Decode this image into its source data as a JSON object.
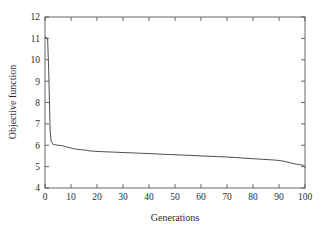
{
  "chart_data": {
    "type": "line",
    "title": "",
    "xlabel": "Generations",
    "ylabel": "Objective function",
    "xlim": [
      0,
      100
    ],
    "ylim": [
      4,
      12
    ],
    "xticks": [
      0,
      10,
      20,
      30,
      40,
      50,
      60,
      70,
      80,
      90,
      100
    ],
    "yticks": [
      4,
      5,
      6,
      7,
      8,
      9,
      10,
      11,
      12
    ],
    "xtick_labels": [
      "0",
      "10",
      "20",
      "30",
      "40",
      "50",
      "60",
      "70",
      "80",
      "90",
      "100"
    ],
    "ytick_labels": [
      "4",
      "5",
      "6",
      "7",
      "8",
      "9",
      "10",
      "11",
      "12"
    ],
    "grid": false,
    "legend": false,
    "legend_position": "none",
    "line_color": "#3a3a3a",
    "frame_color": "#555555",
    "background_color": "#ffffff",
    "series": [
      {
        "name": "Objective function",
        "x": [
          0,
          1,
          1.4,
          1.8,
          2,
          2.4,
          3,
          4,
          5,
          6,
          7,
          8,
          9,
          10,
          11,
          12,
          13,
          14,
          15,
          16,
          17,
          18,
          19,
          20,
          22,
          24,
          26,
          28,
          30,
          32,
          34,
          36,
          38,
          40,
          42,
          44,
          46,
          48,
          50,
          52,
          54,
          56,
          58,
          60,
          62,
          64,
          66,
          68,
          70,
          72,
          74,
          76,
          78,
          80,
          82,
          84,
          86,
          88,
          90,
          91,
          92,
          93,
          94,
          95,
          96,
          97,
          98,
          99,
          99.5,
          100
        ],
        "y": [
          11.05,
          11.0,
          9.6,
          7.6,
          6.6,
          6.18,
          6.05,
          6.02,
          6.0,
          5.99,
          5.97,
          5.93,
          5.9,
          5.87,
          5.84,
          5.82,
          5.8,
          5.79,
          5.78,
          5.76,
          5.74,
          5.73,
          5.72,
          5.71,
          5.7,
          5.69,
          5.68,
          5.67,
          5.66,
          5.65,
          5.64,
          5.63,
          5.62,
          5.61,
          5.6,
          5.585,
          5.575,
          5.565,
          5.555,
          5.545,
          5.535,
          5.525,
          5.515,
          5.5,
          5.49,
          5.48,
          5.47,
          5.46,
          5.45,
          5.435,
          5.42,
          5.4,
          5.385,
          5.37,
          5.355,
          5.34,
          5.325,
          5.31,
          5.29,
          5.27,
          5.25,
          5.22,
          5.19,
          5.16,
          5.13,
          5.11,
          5.09,
          5.07,
          5.05,
          4.97
        ]
      }
    ]
  },
  "figure": {
    "plot_area": {
      "left": 45,
      "top": 17,
      "right": 305,
      "bottom": 188
    }
  }
}
